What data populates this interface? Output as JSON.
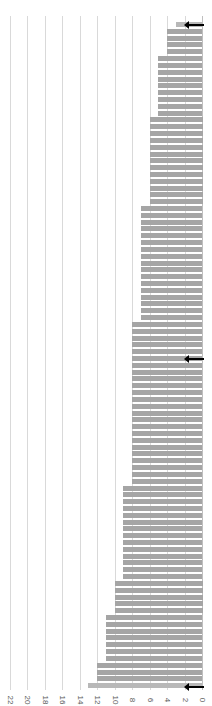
{
  "chart_data": {
    "type": "bar",
    "orientation": "rotated-90-horizontal-bars",
    "title": "",
    "xlabel": "",
    "ylabel": "",
    "value_axis": {
      "ticks": [
        22,
        20,
        18,
        16,
        14,
        12,
        10,
        8,
        6,
        4,
        2,
        0
      ],
      "range": [
        0,
        22
      ],
      "grid": true
    },
    "groups": [
      {
        "value": 3,
        "count": 1
      },
      {
        "value": 4,
        "count": 4
      },
      {
        "value": 5,
        "count": 9
      },
      {
        "value": 6,
        "count": 13
      },
      {
        "value": 7,
        "count": 17
      },
      {
        "value": 8,
        "count": 24
      },
      {
        "value": 9,
        "count": 14
      },
      {
        "value": 10,
        "count": 5
      },
      {
        "value": 11,
        "count": 7
      },
      {
        "value": 12,
        "count": 3
      },
      {
        "value": 13,
        "count": 1
      }
    ],
    "values": [
      3,
      4,
      4,
      4,
      4,
      5,
      5,
      5,
      5,
      5,
      5,
      5,
      5,
      5,
      6,
      6,
      6,
      6,
      6,
      6,
      6,
      6,
      6,
      6,
      6,
      6,
      6,
      7,
      7,
      7,
      7,
      7,
      7,
      7,
      7,
      7,
      7,
      7,
      7,
      7,
      7,
      7,
      7,
      7,
      8,
      8,
      8,
      8,
      8,
      8,
      8,
      8,
      8,
      8,
      8,
      8,
      8,
      8,
      8,
      8,
      8,
      8,
      8,
      8,
      8,
      8,
      8,
      8,
      9,
      9,
      9,
      9,
      9,
      9,
      9,
      9,
      9,
      9,
      9,
      9,
      9,
      9,
      10,
      10,
      10,
      10,
      10,
      11,
      11,
      11,
      11,
      11,
      11,
      11,
      12,
      12,
      12,
      13
    ],
    "annotations": [
      {
        "type": "arrow",
        "position": "first bar (min, value 3)"
      },
      {
        "type": "arrow",
        "position": "middle bar (median, value 8)"
      },
      {
        "type": "arrow",
        "position": "last bar (max, value 13)"
      }
    ],
    "colors": {
      "bar": "#a5a5a5",
      "highlight_bar": "#b8b8b8",
      "grid": "#d9d9d9",
      "arrow": "#000000"
    }
  }
}
